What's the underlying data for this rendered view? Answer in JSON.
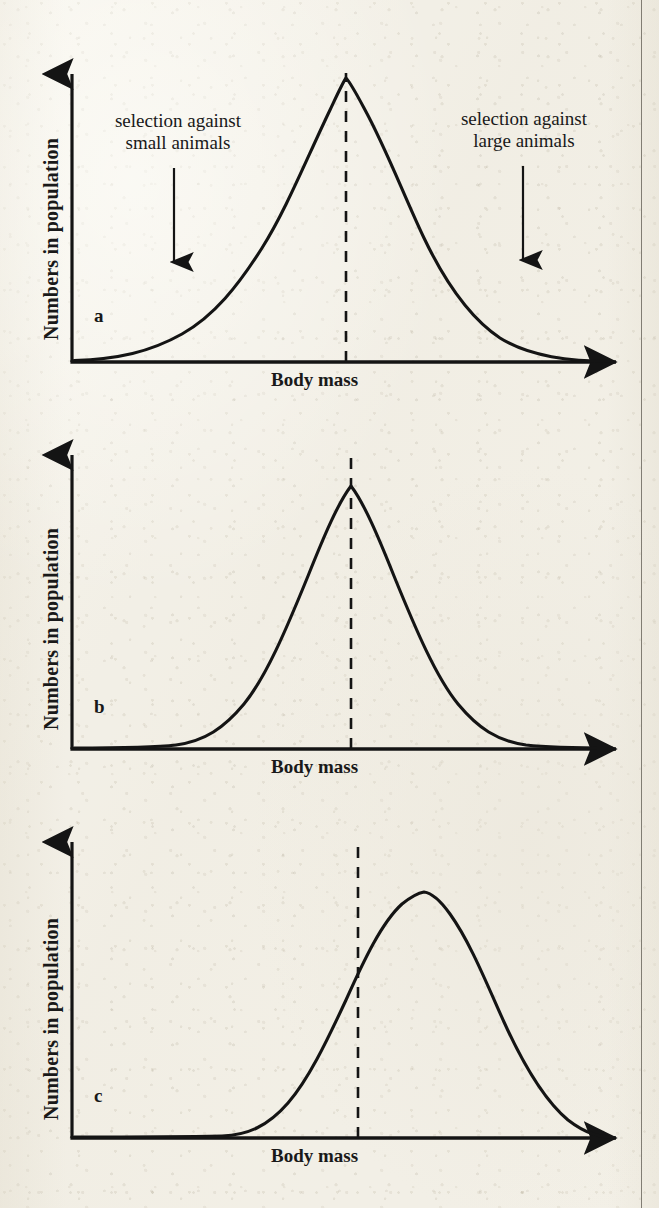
{
  "figure": {
    "kind": "three-panel-bell-curve-figure",
    "background_color": "#f2efe6",
    "ink_color": "#141414",
    "page_edge_rule_x": 641
  },
  "panels": [
    {
      "letter": "a",
      "ylabel": "Numbers in population",
      "xlabel": "Body mass",
      "annotations": [
        {
          "line1": "selection against",
          "line2": "small animals",
          "side": "left"
        },
        {
          "line1": "selection against",
          "line2": "large animals",
          "side": "right"
        }
      ]
    },
    {
      "letter": "b",
      "ylabel": "Numbers in population",
      "xlabel": "Body mass",
      "annotations": []
    },
    {
      "letter": "c",
      "ylabel": "Numbers in population",
      "xlabel": "Body mass",
      "annotations": []
    }
  ],
  "chart_data": [
    {
      "type": "line",
      "title": "a",
      "xlabel": "Body mass",
      "ylabel": "Numbers in population",
      "subtype": "normal-distribution",
      "description": "Broad symmetric bell curve centred on the dashed mean line; arrows mark selection against small animals (left) and large animals (right)",
      "mean": 0.5,
      "sigma": 0.155,
      "peak_height": 1.0,
      "dashed_mean_line_x": 0.5,
      "x": [
        0.0,
        0.05,
        0.1,
        0.15,
        0.2,
        0.25,
        0.3,
        0.35,
        0.4,
        0.45,
        0.5,
        0.55,
        0.6,
        0.65,
        0.7,
        0.75,
        0.8,
        0.85,
        0.9,
        0.95,
        1.0
      ],
      "values": [
        0.005,
        0.011,
        0.025,
        0.053,
        0.102,
        0.181,
        0.294,
        0.436,
        0.589,
        0.729,
        0.83,
        0.871,
        0.849,
        0.771,
        0.653,
        0.518,
        0.387,
        0.271,
        0.178,
        0.11,
        0.064
      ],
      "grid": false,
      "axis_arrows": true,
      "annotations": [
        {
          "text": "selection against small animals",
          "arrow_from_x": 0.225,
          "arrow_to_x": 0.225,
          "direction": "down"
        },
        {
          "text": "selection against large animals",
          "arrow_from_x": 0.818,
          "arrow_to_x": 0.818,
          "direction": "down"
        }
      ]
    },
    {
      "type": "line",
      "title": "b",
      "xlabel": "Body mass",
      "ylabel": "Numbers in population",
      "subtype": "normal-distribution",
      "description": "Narrower symmetric bell curve centred on the dashed mean line (stabilising selection result)",
      "mean": 0.5,
      "sigma": 0.115,
      "peak_height": 1.0,
      "dashed_mean_line_x": 0.5,
      "x": [
        0.0,
        0.05,
        0.1,
        0.15,
        0.2,
        0.25,
        0.3,
        0.35,
        0.4,
        0.45,
        0.5,
        0.55,
        0.6,
        0.65,
        0.7,
        0.75,
        0.8,
        0.85,
        0.9,
        0.95,
        1.0
      ],
      "values": [
        0.0,
        0.001,
        0.003,
        0.012,
        0.041,
        0.115,
        0.262,
        0.487,
        0.748,
        0.943,
        1.0,
        0.943,
        0.748,
        0.487,
        0.262,
        0.115,
        0.041,
        0.012,
        0.003,
        0.001,
        0.0
      ],
      "grid": false,
      "axis_arrows": true,
      "annotations": []
    },
    {
      "type": "line",
      "title": "c",
      "xlabel": "Body mass",
      "ylabel": "Numbers in population",
      "subtype": "normal-distribution-shifted",
      "description": "Bell curve shifted to the right of the dashed original-mean line (directional selection result)",
      "mean": 0.625,
      "sigma": 0.125,
      "peak_height": 1.0,
      "dashed_mean_line_x": 0.5,
      "x": [
        0.0,
        0.05,
        0.1,
        0.15,
        0.2,
        0.25,
        0.3,
        0.35,
        0.4,
        0.45,
        0.5,
        0.55,
        0.6,
        0.65,
        0.7,
        0.75,
        0.8,
        0.85,
        0.9,
        0.95,
        1.0
      ],
      "values": [
        0.0,
        0.0,
        0.001,
        0.003,
        0.011,
        0.034,
        0.091,
        0.208,
        0.407,
        0.682,
        0.923,
        1.0,
        0.969,
        0.819,
        0.595,
        0.37,
        0.197,
        0.09,
        0.035,
        0.012,
        0.003
      ],
      "grid": false,
      "axis_arrows": true,
      "annotations": []
    }
  ]
}
